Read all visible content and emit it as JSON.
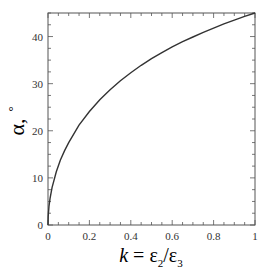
{
  "chart_data": {
    "type": "line",
    "title": "",
    "xlabel": "k = ε2/ε3",
    "xlabel_parts": {
      "var": "k",
      "eq": " = ε",
      "sub1": "2",
      "slash": "/ε",
      "sub2": "3"
    },
    "ylabel": "α, °",
    "ylabel_parts": {
      "symbol": "α,",
      "unit": "°"
    },
    "xlim": [
      0,
      1
    ],
    "ylim": [
      0,
      45
    ],
    "xticks": [
      "0",
      "0.2",
      "0.4",
      "0.6",
      "0.8",
      "1"
    ],
    "yticks": [
      "0",
      "10",
      "20",
      "30",
      "40"
    ],
    "grid": false,
    "legend": null,
    "series": [
      {
        "name": "α(k)",
        "x": [
          0,
          0.001,
          0.005,
          0.01,
          0.02,
          0.04,
          0.06,
          0.08,
          0.1,
          0.15,
          0.2,
          0.25,
          0.3,
          0.35,
          0.4,
          0.45,
          0.5,
          0.55,
          0.6,
          0.65,
          0.7,
          0.75,
          0.8,
          0.85,
          0.9,
          0.95,
          1.0
        ],
        "values": [
          0,
          1.8,
          4.0,
          5.7,
          8.0,
          11.3,
          13.8,
          15.8,
          17.5,
          21.2,
          24.1,
          26.6,
          28.7,
          30.6,
          32.3,
          33.9,
          35.3,
          36.6,
          37.8,
          38.9,
          39.9,
          40.9,
          41.8,
          42.7,
          43.5,
          44.3,
          45.0
        ]
      }
    ]
  },
  "colors": {
    "line": "#333333",
    "axis": "#555555",
    "text": "#333333"
  }
}
